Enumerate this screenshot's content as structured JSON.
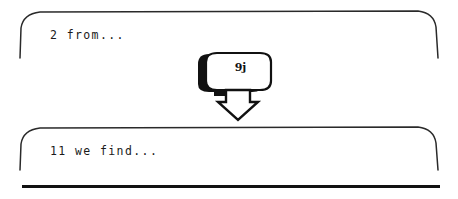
{
  "figure": {
    "type": "flow-diagram",
    "background_color": "#ffffff",
    "ink_color": "#1a1a1a",
    "panels": [
      {
        "name": "top-panel",
        "text": "2 from...",
        "shape": "open-bottom-rounded-rectangle"
      },
      {
        "name": "bottom-panel",
        "text": "11 we find...",
        "shape": "open-bottom-rounded-rectangle"
      }
    ],
    "connector": {
      "name": "down-arrow-button",
      "label": "9j",
      "shadow": true,
      "arrow_direction": "down",
      "arrow_style": "outlined-block-arrow"
    },
    "rule": {
      "name": "bottom-rule",
      "style": "thick-horizontal-line"
    }
  }
}
